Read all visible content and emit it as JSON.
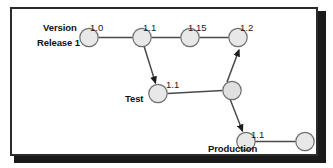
{
  "figure": {
    "type": "version-branching-diagram",
    "colors": {
      "node_fill": "#e8e8e8",
      "node_stroke": "#6f6f6f",
      "edge": "#4a4a4a",
      "frame": "#2b2b2b",
      "shadow": "#1a1a1a",
      "text": "#111111",
      "background": "#ffffff"
    },
    "header": {
      "version_label": "Version"
    },
    "rows": [
      {
        "id": "release1",
        "label": "Release 1"
      },
      {
        "id": "test",
        "label": "Test"
      },
      {
        "id": "production",
        "label": "Production"
      }
    ],
    "nodes": [
      {
        "id": "r1-100",
        "row": "release1",
        "version": "1.0",
        "cx": 87,
        "cy": 36,
        "r": 9.5,
        "show_version": true
      },
      {
        "id": "r1-110",
        "row": "release1",
        "version": "1.1",
        "cx": 140,
        "cy": 36,
        "r": 9.5,
        "show_version": true
      },
      {
        "id": "r1-115",
        "row": "release1",
        "version": "1.15",
        "cx": 188,
        "cy": 36,
        "r": 9.5,
        "show_version": true
      },
      {
        "id": "r1-120",
        "row": "release1",
        "version": "1.2",
        "cx": 236,
        "cy": 36,
        "r": 9.5,
        "show_version": true
      },
      {
        "id": "t-110",
        "row": "test",
        "version": "1.1",
        "cx": 155,
        "cy": 92,
        "r": 9.5,
        "show_version": true
      },
      {
        "id": "t-merge",
        "row": "test",
        "version": "",
        "cx": 230,
        "cy": 88,
        "r": 9.5,
        "show_version": false
      },
      {
        "id": "p-110",
        "row": "production",
        "version": "1.1",
        "cx": 243,
        "cy": 140,
        "r": 9.5,
        "show_version": true
      },
      {
        "id": "p-next",
        "row": "production",
        "version": "",
        "cx": 303,
        "cy": 140,
        "r": 9.5,
        "show_version": false
      }
    ],
    "edges": [
      {
        "from": "r1-100",
        "to": "r1-110",
        "arrow": false,
        "kind": "mainline"
      },
      {
        "from": "r1-110",
        "to": "r1-115",
        "arrow": false,
        "kind": "mainline"
      },
      {
        "from": "r1-115",
        "to": "r1-120",
        "arrow": false,
        "kind": "mainline"
      },
      {
        "from": "r1-110",
        "to": "t-110",
        "arrow": true,
        "kind": "branch"
      },
      {
        "from": "t-110",
        "to": "t-merge",
        "arrow": false,
        "kind": "mainline"
      },
      {
        "from": "t-merge",
        "to": "r1-120",
        "arrow": true,
        "kind": "merge"
      },
      {
        "from": "t-merge",
        "to": "p-110",
        "arrow": true,
        "kind": "branch"
      },
      {
        "from": "p-110",
        "to": "p-next",
        "arrow": false,
        "kind": "mainline"
      }
    ]
  }
}
